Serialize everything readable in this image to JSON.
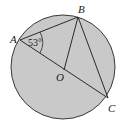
{
  "diagram": {
    "type": "geometry-circle-inscribed-triangle",
    "circle": {
      "cx": 63,
      "cy": 67,
      "r": 52,
      "fill": "#c9c9c9",
      "stroke": "#3a3a3a"
    },
    "points": {
      "A": {
        "label": "A",
        "x": 20,
        "y": 40
      },
      "B": {
        "label": "B",
        "x": 78,
        "y": 17
      },
      "C": {
        "label": "C",
        "x": 108,
        "y": 98
      },
      "O": {
        "label": "O",
        "x": 64,
        "y": 70
      }
    },
    "segments": [
      "AB",
      "AC",
      "BC",
      "BO"
    ],
    "angle_A": {
      "label": "53°",
      "value": 53
    }
  }
}
